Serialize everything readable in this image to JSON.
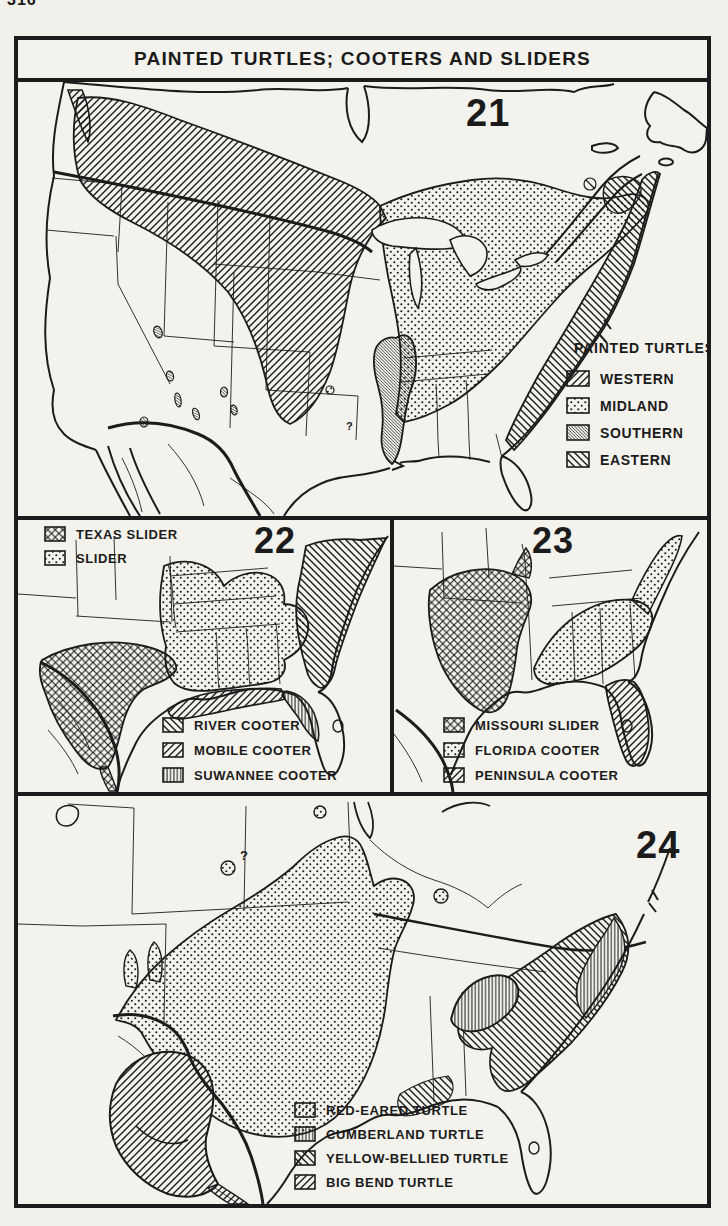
{
  "page_number": "316",
  "title": "PAINTED TURTLES; COOTERS AND SLIDERS",
  "panels": [
    {
      "number": "21",
      "legend_title": "PAINTED TURTLES",
      "uncertainty_mark": "?",
      "legend": [
        {
          "label": "WESTERN",
          "pattern": "diagonal-forward-hatch"
        },
        {
          "label": "MIDLAND",
          "pattern": "dots"
        },
        {
          "label": "SOUTHERN",
          "pattern": "dense-diagonal-hatch"
        },
        {
          "label": "EASTERN",
          "pattern": "diagonal-back-hatch"
        }
      ]
    },
    {
      "number": "22",
      "legend_top": [
        {
          "label": "TEXAS SLIDER",
          "pattern": "crosshatch"
        },
        {
          "label": "SLIDER",
          "pattern": "dots"
        }
      ],
      "legend_bottom": [
        {
          "label": "RIVER COOTER",
          "pattern": "diagonal-back-hatch"
        },
        {
          "label": "MOBILE COOTER",
          "pattern": "diagonal-forward-hatch"
        },
        {
          "label": "SUWANNEE COOTER",
          "pattern": "fine-vertical-hatch"
        }
      ]
    },
    {
      "number": "23",
      "legend": [
        {
          "label": "MISSOURI SLIDER",
          "pattern": "crosshatch"
        },
        {
          "label": "FLORIDA COOTER",
          "pattern": "dots"
        },
        {
          "label": "PENINSULA COOTER",
          "pattern": "diagonal-forward-hatch"
        }
      ]
    },
    {
      "number": "24",
      "uncertainty_mark": "?",
      "legend": [
        {
          "label": "RED-EARED TURTLE",
          "pattern": "dots"
        },
        {
          "label": "CUMBERLAND TURTLE",
          "pattern": "fine-vertical-hatch"
        },
        {
          "label": "YELLOW-BELLIED TURTLE",
          "pattern": "diagonal-back-hatch"
        },
        {
          "label": "BIG BEND TURTLE",
          "pattern": "diagonal-forward-hatch"
        }
      ]
    }
  ]
}
